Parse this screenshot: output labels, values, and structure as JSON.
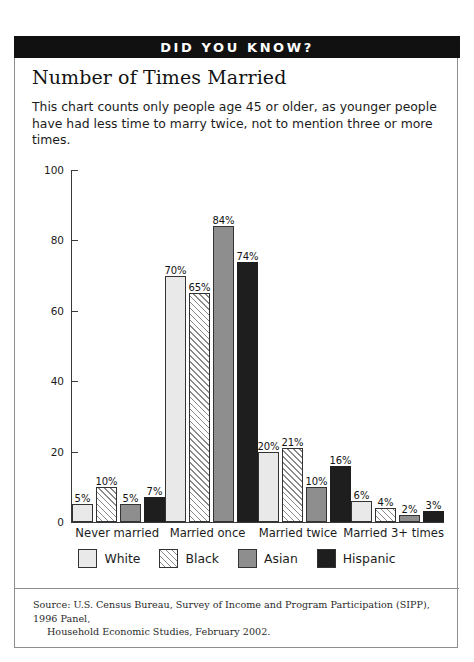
{
  "banner": {
    "label": "DID YOU KNOW?"
  },
  "title": "Number of Times Married",
  "intro": "This chart counts only people age 45 or older, as younger people have had less time to marry twice, not to mention three or more times.",
  "source": {
    "line1": "Source:  U.S. Census Bureau, Survey of Income and Program Participation (SIPP), 1996 Panel,",
    "line2": "Household Economic Studies, February 2002."
  },
  "colors": {
    "white": "#e9e9e9",
    "black": "#ffffff",
    "asian": "#8e8e8e",
    "hispanic": "#1e1e1e",
    "banner_bg": "#111111",
    "frame": "#8e8e8e",
    "axis": "#3a3a3a"
  },
  "chart_data": {
    "type": "bar",
    "title": "Number of Times Married",
    "xlabel": "",
    "ylabel": "",
    "ylim": [
      0,
      100
    ],
    "yticks": [
      0,
      20,
      40,
      60,
      80,
      100
    ],
    "ytick_labels": [
      "0",
      "20",
      "40",
      "60",
      "80",
      "100"
    ],
    "grid": false,
    "legend_position": "bottom",
    "categories": [
      "Never married",
      "Married once",
      "Married twice",
      "Married 3+ times"
    ],
    "series": [
      {
        "name": "White",
        "values": [
          5,
          70,
          20,
          6
        ],
        "labels": [
          "5%",
          "70%",
          "20%",
          "6%"
        ],
        "swatch": "sw-white"
      },
      {
        "name": "Black",
        "values": [
          10,
          65,
          21,
          4
        ],
        "labels": [
          "10%",
          "65%",
          "21%",
          "4%"
        ],
        "swatch": "sw-black"
      },
      {
        "name": "Asian",
        "values": [
          5,
          84,
          10,
          2
        ],
        "labels": [
          "5%",
          "84%",
          "10%",
          "2%"
        ],
        "swatch": "sw-asian"
      },
      {
        "name": "Hispanic",
        "values": [
          7,
          74,
          16,
          3
        ],
        "labels": [
          "7%",
          "74%",
          "16%",
          "3%"
        ],
        "swatch": "sw-hisp"
      }
    ]
  }
}
